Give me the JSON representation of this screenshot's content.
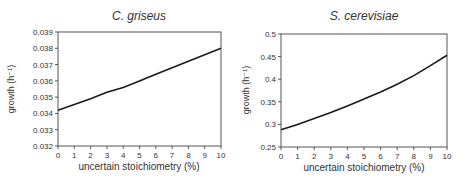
{
  "chart_data": [
    {
      "type": "line",
      "title": "C. griseus",
      "xlabel": "uncertain stoichiometry (%)",
      "ylabel": "growth",
      "ylabel_unit": "(h⁻¹)",
      "x": [
        0,
        1,
        2,
        3,
        4,
        5,
        6,
        7,
        8,
        9,
        10
      ],
      "series": [
        {
          "name": "C. griseus growth",
          "values": [
            0.0342,
            0.03455,
            0.0349,
            0.0353,
            0.0356,
            0.036,
            0.0364,
            0.0368,
            0.0372,
            0.0376,
            0.038
          ]
        }
      ],
      "xlim": [
        0,
        10
      ],
      "ylim": [
        0.032,
        0.039
      ],
      "xticks": [
        "0",
        "1",
        "2",
        "3",
        "4",
        "5",
        "6",
        "7",
        "8",
        "9",
        "10"
      ],
      "yticks": [
        "0.032",
        "0.033",
        "0.034",
        "0.035",
        "0.036",
        "0.037",
        "0.038",
        "0.039"
      ],
      "grid": false,
      "legend": "none"
    },
    {
      "type": "line",
      "title": "S. cerevisiae",
      "xlabel": "uncertain stoichiometry (%)",
      "ylabel": "growth",
      "ylabel_unit": "(h⁻¹)",
      "x": [
        0,
        1,
        2,
        3,
        4,
        5,
        6,
        7,
        8,
        9,
        10
      ],
      "series": [
        {
          "name": "S. cerevisiae growth",
          "values": [
            0.288,
            0.3,
            0.313,
            0.326,
            0.341,
            0.356,
            0.372,
            0.389,
            0.408,
            0.43,
            0.453
          ]
        }
      ],
      "xlim": [
        0,
        10
      ],
      "ylim": [
        0.25,
        0.5
      ],
      "xticks": [
        "0",
        "1",
        "2",
        "3",
        "4",
        "5",
        "6",
        "7",
        "8",
        "9",
        "10"
      ],
      "yticks": [
        "0.25",
        "0.3",
        "0.35",
        "0.4",
        "0.45",
        "0.5"
      ],
      "grid": false,
      "legend": "none"
    }
  ],
  "colors": {
    "line": "#1a1a1a",
    "axis": "#555555",
    "text": "#333333"
  }
}
